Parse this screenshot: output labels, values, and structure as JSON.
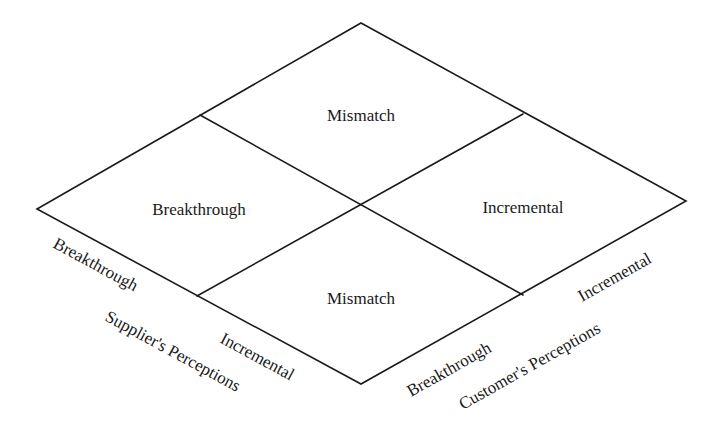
{
  "diagram": {
    "type": "2x2 matrix (rotated 45°)",
    "quadrants": {
      "top": "Mismatch",
      "left": "Breakthrough",
      "right": "Incremental",
      "bottom": "Mismatch"
    },
    "axes": {
      "supplier": {
        "title": "Supplier's Perceptions",
        "ticks": [
          "Breakthrough",
          "Incremental"
        ]
      },
      "customer": {
        "title": "Customer's Perceptions",
        "ticks": [
          "Breakthrough",
          "Incremental"
        ]
      }
    },
    "colors": {
      "line": "#1a1a1a",
      "text": "#1a1a1a",
      "background": "#ffffff"
    }
  }
}
